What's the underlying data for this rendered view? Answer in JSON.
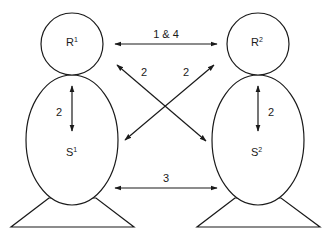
{
  "diagram": {
    "colors": {
      "stroke": "#1a1a1a",
      "background": "#ffffff"
    },
    "persons": [
      {
        "id": "person-1",
        "head_label": "R",
        "head_sup": "1",
        "body_label": "S",
        "body_sup": "1",
        "internal_arrow_label": "2"
      },
      {
        "id": "person-2",
        "head_label": "R",
        "head_sup": "2",
        "body_label": "S",
        "body_sup": "2",
        "internal_arrow_label": "2"
      }
    ],
    "arrows": [
      {
        "id": "R1-R2",
        "label": "1 & 4",
        "from": "R1",
        "to": "R2"
      },
      {
        "id": "R1-S2",
        "label": "2",
        "from": "R1",
        "to": "S2"
      },
      {
        "id": "S1-R2",
        "label": "2",
        "from": "S1",
        "to": "R2"
      },
      {
        "id": "S1-S2",
        "label": "3",
        "from": "S1",
        "to": "S2"
      }
    ]
  }
}
